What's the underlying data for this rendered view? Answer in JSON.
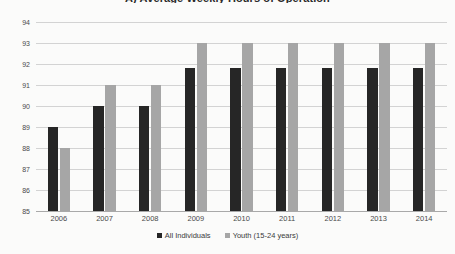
{
  "chart_data": {
    "type": "bar",
    "title": "A) Average Weekly Hours of Operation",
    "xlabel": "",
    "ylabel": "",
    "ylim": [
      85,
      94
    ],
    "ytick_step": 1,
    "yticks": [
      "94",
      "93",
      "92",
      "91",
      "90",
      "89",
      "88",
      "87",
      "86",
      "85"
    ],
    "grid": true,
    "legend_position": "bottom",
    "categories": [
      "2006",
      "2007",
      "2008",
      "2009",
      "2010",
      "2011",
      "2012",
      "2013",
      "2014"
    ],
    "series": [
      {
        "name": "All Individuals",
        "color": "#262626",
        "values": [
          89.0,
          90.0,
          90.0,
          91.8,
          91.8,
          91.8,
          91.8,
          91.8,
          91.8
        ]
      },
      {
        "name": "Youth (15-24 years)",
        "color": "#a6a6a6",
        "values": [
          88.0,
          91.0,
          91.0,
          93.0,
          93.0,
          93.0,
          93.0,
          93.0,
          93.0
        ]
      }
    ]
  },
  "colors": {
    "series_all_individuals": "#262626",
    "series_youth": "#a6a6a6",
    "gridline": "#d3d3d3",
    "axis": "#a9a9a9",
    "background": "#fbfbfa",
    "text": "#3a3a3a"
  }
}
